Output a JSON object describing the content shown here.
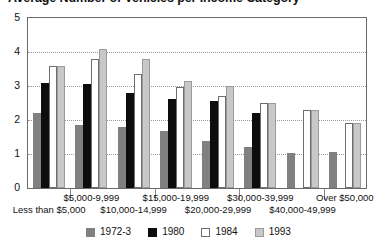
{
  "chart_data": {
    "type": "bar",
    "title": "Average Number of Vehicles per Income Category",
    "xlabel": "",
    "ylabel": "",
    "ylim": [
      0,
      5
    ],
    "yticks": [
      0,
      1,
      2,
      3,
      4,
      5
    ],
    "grid": true,
    "legend_position": "bottom",
    "categories": [
      "Less than $5,000",
      "$5,000-9,999",
      "$10,000-14,999",
      "$15,000-19,999",
      "$20,000-29,999",
      "$30,000-39,999",
      "$40,000-49,999",
      "Over $50,000"
    ],
    "series": [
      {
        "name": "1972-3",
        "color": "#808080",
        "values": [
          2.2,
          1.85,
          1.78,
          1.67,
          1.38,
          1.22,
          1.03,
          1.05
        ]
      },
      {
        "name": "1980",
        "color": "#0d0d0d",
        "values": [
          3.1,
          3.05,
          2.8,
          2.62,
          2.55,
          2.2,
          null,
          null
        ]
      },
      {
        "name": "1984",
        "color": "#ffffff",
        "values": [
          3.6,
          3.8,
          3.35,
          2.98,
          2.72,
          2.5,
          2.28,
          1.9
        ]
      },
      {
        "name": "1993",
        "color": "#c8c8c8",
        "values": [
          3.6,
          4.1,
          3.8,
          3.15,
          3.0,
          2.5,
          2.3,
          1.9
        ]
      }
    ]
  },
  "axis": {
    "y_tick_labels": [
      "5",
      "4",
      "3",
      "2",
      "1",
      "0"
    ]
  },
  "legend": {
    "items": [
      {
        "label": "1972-3"
      },
      {
        "label": "1980"
      },
      {
        "label": "1984"
      },
      {
        "label": "1993"
      }
    ]
  }
}
